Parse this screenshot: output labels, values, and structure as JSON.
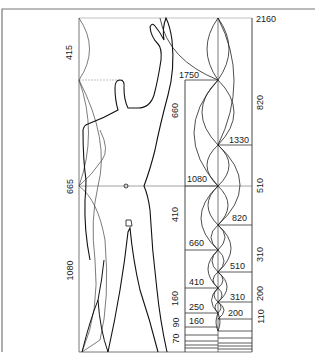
{
  "diagram": {
    "colors": {
      "ink": "#1a1a1a",
      "thin": "#555555",
      "frame": "#777777",
      "background": "#ffffff"
    },
    "left_scale": {
      "labels": [
        "415",
        "665",
        "1080"
      ]
    },
    "red_series_labels": [
      "2160",
      "1330",
      "820",
      "510",
      "310",
      "200"
    ],
    "blue_series_labels": [
      "1750",
      "1080",
      "660",
      "410",
      "250",
      "160"
    ],
    "right_interval_labels": [
      "820",
      "510",
      "310",
      "200",
      "110"
    ],
    "left_interval_labels": [
      "660",
      "410",
      "160",
      "90",
      "70"
    ]
  }
}
